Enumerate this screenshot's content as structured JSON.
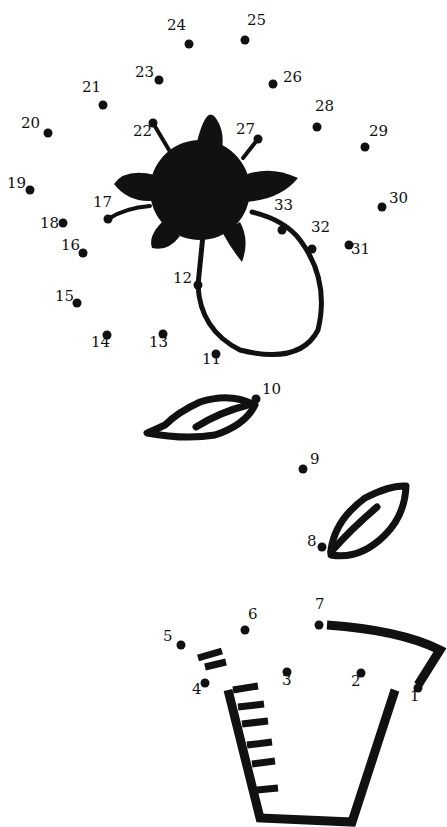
{
  "puzzle": {
    "type": "connect-the-dots",
    "ink_color": "#111111",
    "background": "#ffffff",
    "dots": [
      {
        "n": "1",
        "x": 418,
        "y": 688,
        "lx": 410,
        "ly": 697
      },
      {
        "n": "2",
        "x": 361,
        "y": 673,
        "lx": 351,
        "ly": 682
      },
      {
        "n": "3",
        "x": 287,
        "y": 672,
        "lx": 282,
        "ly": 681
      },
      {
        "n": "4",
        "x": 205,
        "y": 683,
        "lx": 192,
        "ly": 690
      },
      {
        "n": "5",
        "x": 181,
        "y": 645,
        "lx": 163,
        "ly": 637
      },
      {
        "n": "6",
        "x": 245,
        "y": 630,
        "lx": 248,
        "ly": 615
      },
      {
        "n": "7",
        "x": 319,
        "y": 625,
        "lx": 315,
        "ly": 605
      },
      {
        "n": "8",
        "x": 322,
        "y": 547,
        "lx": 307,
        "ly": 542
      },
      {
        "n": "9",
        "x": 303,
        "y": 469,
        "lx": 310,
        "ly": 460
      },
      {
        "n": "10",
        "x": 256,
        "y": 399,
        "lx": 262,
        "ly": 390
      },
      {
        "n": "11",
        "x": 216,
        "y": 354,
        "lx": 202,
        "ly": 360
      },
      {
        "n": "12",
        "x": 198,
        "y": 285,
        "lx": 173,
        "ly": 279
      },
      {
        "n": "13",
        "x": 163,
        "y": 334,
        "lx": 149,
        "ly": 343
      },
      {
        "n": "14",
        "x": 107,
        "y": 335,
        "lx": 91,
        "ly": 343
      },
      {
        "n": "15",
        "x": 77,
        "y": 303,
        "lx": 55,
        "ly": 297
      },
      {
        "n": "16",
        "x": 83,
        "y": 253,
        "lx": 61,
        "ly": 246
      },
      {
        "n": "17",
        "x": 108,
        "y": 219,
        "lx": 93,
        "ly": 203
      },
      {
        "n": "18",
        "x": 63,
        "y": 223,
        "lx": 40,
        "ly": 224
      },
      {
        "n": "19",
        "x": 30,
        "y": 190,
        "lx": 7,
        "ly": 184
      },
      {
        "n": "20",
        "x": 48,
        "y": 133,
        "lx": 21,
        "ly": 124
      },
      {
        "n": "21",
        "x": 103,
        "y": 105,
        "lx": 82,
        "ly": 88
      },
      {
        "n": "22",
        "x": 153,
        "y": 123,
        "lx": 133,
        "ly": 132
      },
      {
        "n": "23",
        "x": 159,
        "y": 80,
        "lx": 135,
        "ly": 73
      },
      {
        "n": "24",
        "x": 189,
        "y": 44,
        "lx": 167,
        "ly": 26
      },
      {
        "n": "25",
        "x": 245,
        "y": 40,
        "lx": 247,
        "ly": 21
      },
      {
        "n": "26",
        "x": 273,
        "y": 84,
        "lx": 283,
        "ly": 78
      },
      {
        "n": "27",
        "x": 258,
        "y": 139,
        "lx": 236,
        "ly": 130
      },
      {
        "n": "28",
        "x": 317,
        "y": 127,
        "lx": 315,
        "ly": 107
      },
      {
        "n": "29",
        "x": 365,
        "y": 147,
        "lx": 369,
        "ly": 132
      },
      {
        "n": "30",
        "x": 382,
        "y": 207,
        "lx": 389,
        "ly": 199
      },
      {
        "n": "31",
        "x": 349,
        "y": 245,
        "lx": 351,
        "ly": 250
      },
      {
        "n": "32",
        "x": 312,
        "y": 249,
        "lx": 311,
        "ly": 228
      },
      {
        "n": "33",
        "x": 282,
        "y": 230,
        "lx": 274,
        "ly": 206
      }
    ]
  }
}
